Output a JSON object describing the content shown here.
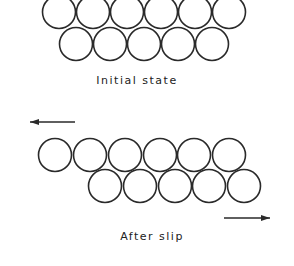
{
  "diagram": {
    "panels": [
      {
        "id": "initial",
        "label": "Initial state",
        "top_row": {
          "cy": 12,
          "r": 16.5,
          "cx": [
            59,
            93,
            127,
            161,
            195,
            229
          ]
        },
        "bottom_row": {
          "cy": 44,
          "r": 16.5,
          "cx": [
            76,
            110,
            144,
            178,
            212
          ]
        },
        "arrows": []
      },
      {
        "id": "after-slip",
        "label": "After slip",
        "top_row": {
          "cy": 155,
          "r": 16.5,
          "cx": [
            55,
            90,
            125,
            160,
            194,
            229
          ]
        },
        "bottom_row": {
          "cy": 186,
          "r": 16.5,
          "cx": [
            105,
            140,
            175,
            209,
            244
          ]
        },
        "arrows": [
          {
            "direction": "left",
            "x1": 75,
            "x2": 30,
            "y": 122
          },
          {
            "direction": "right",
            "x1": 224,
            "x2": 270,
            "y": 218
          }
        ]
      }
    ],
    "text": {
      "initial_label": "Initial state",
      "after_label": "After slip"
    }
  }
}
